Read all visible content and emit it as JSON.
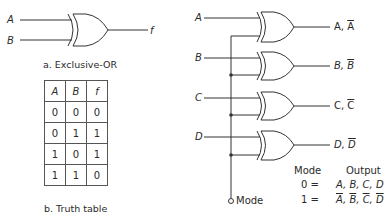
{
  "figure_a": {
    "inputs": [
      "A",
      "B"
    ],
    "output": "f",
    "caption": "a. Exclusive-OR"
  },
  "figure_b": {
    "caption": "b. Truth table",
    "headers": [
      "A",
      "B",
      "f"
    ],
    "rows": [
      [
        "0",
        "0",
        "0"
      ],
      [
        "0",
        "1",
        "1"
      ],
      [
        "1",
        "0",
        "1"
      ],
      [
        "1",
        "1",
        "0"
      ]
    ]
  },
  "figure_c": {
    "inputs": [
      "A",
      "B",
      "C",
      "D"
    ],
    "outputs": [
      {
        "plain": "A,",
        "bar": "A"
      },
      {
        "plain": "B,",
        "bar": "B"
      },
      {
        "plain": "C,",
        "bar": "C"
      },
      {
        "plain": "D,",
        "bar": "D"
      }
    ],
    "mode_label": "Mode",
    "table": {
      "header_mode": "Mode",
      "header_output": "Output",
      "row0_mode": "0 =",
      "row0_output": "A, B, C, D",
      "row1_mode": "1 =",
      "row1_output": [
        "A",
        "B",
        "C",
        "D"
      ]
    }
  }
}
